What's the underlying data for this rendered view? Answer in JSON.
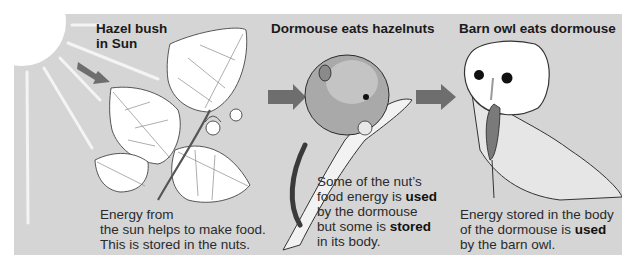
{
  "diagram": {
    "type": "food-chain",
    "colors": {
      "panel_bg": "#d5d5d5",
      "arrow": "#6e6e6e",
      "sun": "#ffffff"
    },
    "stages": [
      {
        "title_line1": "Hazel bush",
        "title_line2": "in Sun",
        "caption_lines": [
          "Energy from",
          "the sun helps to make food.",
          "This is stored in the nuts."
        ]
      },
      {
        "title": "Dormouse eats hazelnuts",
        "caption": {
          "l1": "Some of the nut’s",
          "l2a": "food energy is ",
          "l2b": "used",
          "l3": "by the dormouse",
          "l4a": "but some is ",
          "l4b": "stored",
          "l5": "in its body."
        }
      },
      {
        "title": "Barn owl eats dormouse",
        "caption": {
          "l1": "Energy stored in the body",
          "l2a": "of the dormouse is ",
          "l2b": "used",
          "l3": "by the barn owl."
        }
      }
    ],
    "arrows": [
      "sun-to-hazel",
      "hazel-to-dormouse",
      "dormouse-to-owl"
    ]
  }
}
